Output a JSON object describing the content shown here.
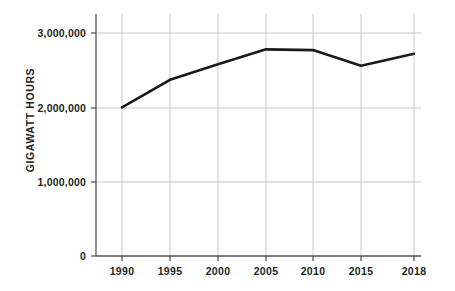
{
  "chart_data": {
    "type": "line",
    "title": "",
    "subtitle": "",
    "xlabel": "",
    "ylabel": "GIGAWATT HOURS",
    "x": [
      1990,
      1995,
      2000,
      2005,
      2010,
      2015,
      2018
    ],
    "categories": [
      "1990",
      "1995",
      "2000",
      "2005",
      "2010",
      "2015",
      "2018"
    ],
    "values": [
      2000000,
      2370000,
      2580000,
      2780000,
      2770000,
      2560000,
      2720000
    ],
    "series": [
      {
        "name": "Gigawatt hours",
        "values": [
          2000000,
          2370000,
          2580000,
          2780000,
          2770000,
          2560000,
          2720000
        ]
      }
    ],
    "ylim": [
      0,
      3000000
    ],
    "xlim": [
      1990,
      2018
    ],
    "y_ticks": [
      0,
      1000000,
      2000000,
      3000000
    ],
    "y_tick_labels": [
      "0",
      "1,000,000",
      "2,000,000",
      "3,000,000"
    ],
    "x_ticks": [
      1990,
      1995,
      2000,
      2005,
      2010,
      2015,
      2018
    ],
    "x_tick_labels": [
      "1990",
      "1995",
      "2000",
      "2005",
      "2010",
      "2015",
      "2018"
    ],
    "grid": true,
    "grid_axis": "both",
    "legend": false,
    "legend_position": "none",
    "line_color": "#1a1a1a",
    "grid_color": "#c8c8c8",
    "axis_color": "#6e6e6e",
    "background_color": "#ffffff",
    "annotations": []
  },
  "axis": {
    "y_title": "GIGAWATT HOURS",
    "y_labels": {
      "t0": "0",
      "t1": "1,000,000",
      "t2": "2,000,000",
      "t3": "3,000,000"
    },
    "x_labels": {
      "t0": "1990",
      "t1": "1995",
      "t2": "2000",
      "t3": "2005",
      "t4": "2010",
      "t5": "2015",
      "t6": "2018"
    }
  }
}
